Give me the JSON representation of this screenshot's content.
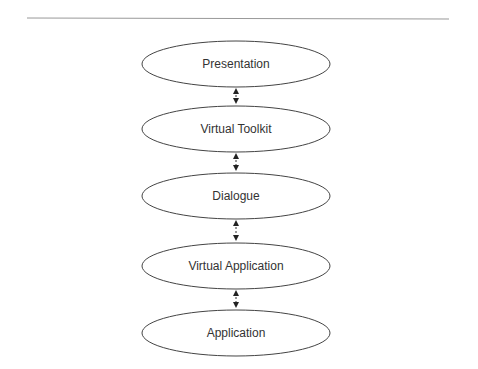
{
  "diagram": {
    "type": "layered-stack",
    "layers": [
      {
        "label": "Presentation",
        "cy": 64
      },
      {
        "label": "Virtual Toolkit",
        "cy": 129
      },
      {
        "label": "Dialogue",
        "cy": 196
      },
      {
        "label": "Virtual Application",
        "cy": 266
      },
      {
        "label": "Application",
        "cy": 333
      }
    ],
    "connector": "bidirectional-dashed-arrow",
    "colors": {
      "stroke": "#444444",
      "text": "#333333",
      "rule": "#999999"
    }
  }
}
